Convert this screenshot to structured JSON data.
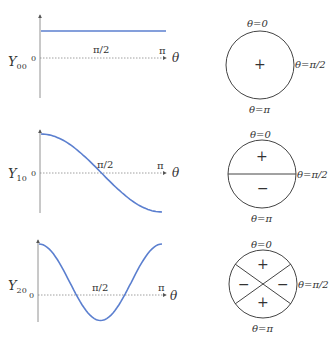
{
  "colors": {
    "curve": "#5b7fcf",
    "axis": "#777777",
    "circle": "#444444"
  },
  "rows": [
    {
      "label": "Y",
      "subscript": "00",
      "zero_tick": "0",
      "mid_tick": "π/2",
      "end_tick": "π",
      "axis_var": "θ",
      "circle": {
        "top": "θ=0",
        "right": "θ=π/2",
        "bottom": "θ=π",
        "signs": [
          "+"
        ]
      }
    },
    {
      "label": "Y",
      "subscript": "10",
      "zero_tick": "0",
      "mid_tick": "π/2",
      "end_tick": "π",
      "axis_var": "θ",
      "circle": {
        "top": "θ=0",
        "right": "θ=π/2",
        "bottom": "θ=π",
        "signs": [
          "+",
          "−"
        ]
      }
    },
    {
      "label": "Y",
      "subscript": "20",
      "zero_tick": "0",
      "mid_tick": "π/2",
      "end_tick": "π",
      "axis_var": "θ",
      "circle": {
        "top": "θ=0",
        "right": "θ=π/2",
        "bottom": "θ=π",
        "signs": [
          "+",
          "−",
          "−",
          "+"
        ]
      }
    }
  ],
  "chart_data": [
    {
      "type": "line",
      "title": "Y00",
      "xlabel": "θ",
      "x_ticks": [
        "0",
        "π/2",
        "π"
      ],
      "xlim": [
        "0",
        "π"
      ],
      "series": [
        {
          "name": "Y00",
          "function": "constant",
          "values": [
            0.28,
            0.28,
            0.28
          ]
        }
      ]
    },
    {
      "type": "line",
      "title": "Y10",
      "xlabel": "θ",
      "x_ticks": [
        "0",
        "π/2",
        "π"
      ],
      "xlim": [
        "0",
        "π"
      ],
      "series": [
        {
          "name": "Y10",
          "function": "cos θ",
          "values": [
            1,
            0,
            -1
          ]
        }
      ]
    },
    {
      "type": "line",
      "title": "Y20",
      "xlabel": "θ",
      "x_ticks": [
        "0",
        "π/2",
        "π"
      ],
      "xlim": [
        "0",
        "π"
      ],
      "series": [
        {
          "name": "Y20",
          "function": "3cos²θ − 1",
          "values": [
            2,
            -1,
            2
          ]
        }
      ]
    }
  ]
}
